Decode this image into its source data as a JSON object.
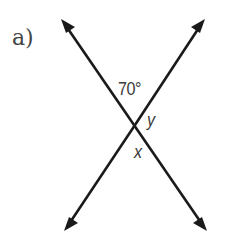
{
  "figure": {
    "part_label": "a)",
    "angle_label": "70°",
    "variables": {
      "y": "y",
      "x": "x"
    },
    "colors": {
      "line": "#1a1a1a",
      "text": "#3a3a3a",
      "background": "#ffffff"
    },
    "lines": [
      {
        "name": "line-top-left-to-bottom-right",
        "from": [
          61,
          19
        ],
        "to": [
          207,
          231
        ]
      },
      {
        "name": "line-top-right-to-bottom-left",
        "from": [
          205,
          19
        ],
        "to": [
          64,
          231
        ]
      }
    ],
    "intersection": [
      135,
      127
    ]
  }
}
